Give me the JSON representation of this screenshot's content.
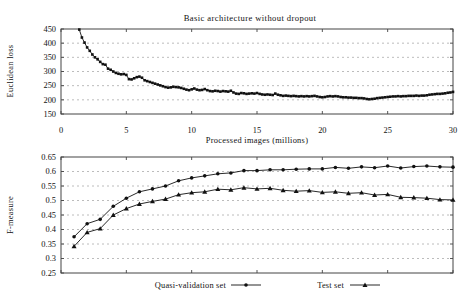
{
  "page": {
    "background": "#ffffff"
  },
  "colors": {
    "data": "#111111",
    "grid": "#ababab",
    "axis": "#444444",
    "text": "#111111"
  },
  "chart_data": [
    {
      "type": "line",
      "title": "Basic architecture without dropout",
      "xlabel": "Processed images (millions)",
      "ylabel": "Euclidean loss",
      "xlim": [
        0,
        30
      ],
      "ylim": [
        150,
        450
      ],
      "xticks": [
        0,
        5,
        10,
        15,
        20,
        25,
        30
      ],
      "xtick_labels": [
        "0",
        "5",
        "10",
        "15",
        "20",
        "25",
        "30"
      ],
      "yticks": [
        150,
        200,
        250,
        300,
        350,
        400,
        450
      ],
      "ytick_labels": [
        "150",
        "200",
        "250",
        "300",
        "350",
        "400",
        "450"
      ],
      "grid": "horizontal-dashed",
      "legend": null,
      "series": [
        {
          "name": "Euclidean loss",
          "marker": "square",
          "x_start": 1.4,
          "x_step": 0.2,
          "y": [
            448,
            420,
            402,
            385,
            373,
            360,
            350,
            343,
            334,
            326,
            324,
            310,
            306,
            300,
            295,
            292,
            290,
            291,
            288,
            273,
            272,
            276,
            280,
            282,
            278,
            269,
            266,
            263,
            260,
            257,
            254,
            251,
            248,
            245,
            243,
            244,
            246,
            245,
            244,
            242,
            239,
            236,
            234,
            237,
            240,
            236,
            234,
            235,
            238,
            234,
            231,
            230,
            232,
            231,
            229,
            231,
            230,
            229,
            232,
            226,
            222,
            221,
            224,
            223,
            221,
            222,
            223,
            222,
            224,
            221,
            219,
            218,
            219,
            218,
            217,
            222,
            218,
            216,
            214,
            215,
            214,
            213,
            214,
            213,
            212,
            213,
            212,
            213,
            212,
            213,
            214,
            212,
            210,
            209,
            210,
            212,
            213,
            212,
            213,
            212,
            210,
            209,
            209,
            208,
            208,
            207,
            207,
            206,
            206,
            205,
            203,
            202,
            203,
            204,
            206,
            207,
            208,
            209,
            210,
            211,
            212,
            212,
            213,
            212,
            213,
            213,
            214,
            214,
            214,
            215,
            214,
            215,
            215,
            216,
            218,
            219,
            220,
            221,
            221,
            222,
            223,
            225,
            226,
            228
          ]
        }
      ]
    },
    {
      "type": "line",
      "title": "",
      "xlabel": "",
      "ylabel": "F-measure",
      "xlim": [
        0,
        30
      ],
      "ylim": [
        0.25,
        0.65
      ],
      "xticks": [
        0,
        5,
        10,
        15,
        20,
        25,
        30
      ],
      "xtick_labels": [],
      "yticks": [
        0.25,
        0.3,
        0.35,
        0.4,
        0.45,
        0.5,
        0.55,
        0.6,
        0.65
      ],
      "ytick_labels": [
        "0.25",
        "0.3",
        "0.35",
        "0.4",
        "0.45",
        "0.5",
        "0.55",
        "0.6",
        "0.65"
      ],
      "grid": "horizontal-dashed",
      "legend": {
        "position": "below",
        "entries": [
          {
            "label": "Quasi-validation set",
            "marker": "circle"
          },
          {
            "label": "Test set",
            "marker": "triangle"
          }
        ]
      },
      "series": [
        {
          "name": "Quasi-validation set",
          "marker": "circle",
          "x_start": 1,
          "x_step": 1,
          "y": [
            0.375,
            0.42,
            0.435,
            0.48,
            0.508,
            0.53,
            0.54,
            0.55,
            0.568,
            0.578,
            0.585,
            0.592,
            0.595,
            0.603,
            0.603,
            0.606,
            0.606,
            0.608,
            0.609,
            0.609,
            0.614,
            0.611,
            0.616,
            0.613,
            0.619,
            0.612,
            0.617,
            0.619,
            0.616,
            0.615
          ]
        },
        {
          "name": "Test set",
          "marker": "triangle",
          "x_start": 1,
          "x_step": 1,
          "y": [
            0.342,
            0.39,
            0.403,
            0.45,
            0.472,
            0.488,
            0.497,
            0.505,
            0.52,
            0.527,
            0.53,
            0.539,
            0.537,
            0.544,
            0.54,
            0.542,
            0.535,
            0.532,
            0.534,
            0.528,
            0.53,
            0.525,
            0.527,
            0.519,
            0.521,
            0.511,
            0.51,
            0.508,
            0.503,
            0.502
          ]
        }
      ]
    }
  ]
}
